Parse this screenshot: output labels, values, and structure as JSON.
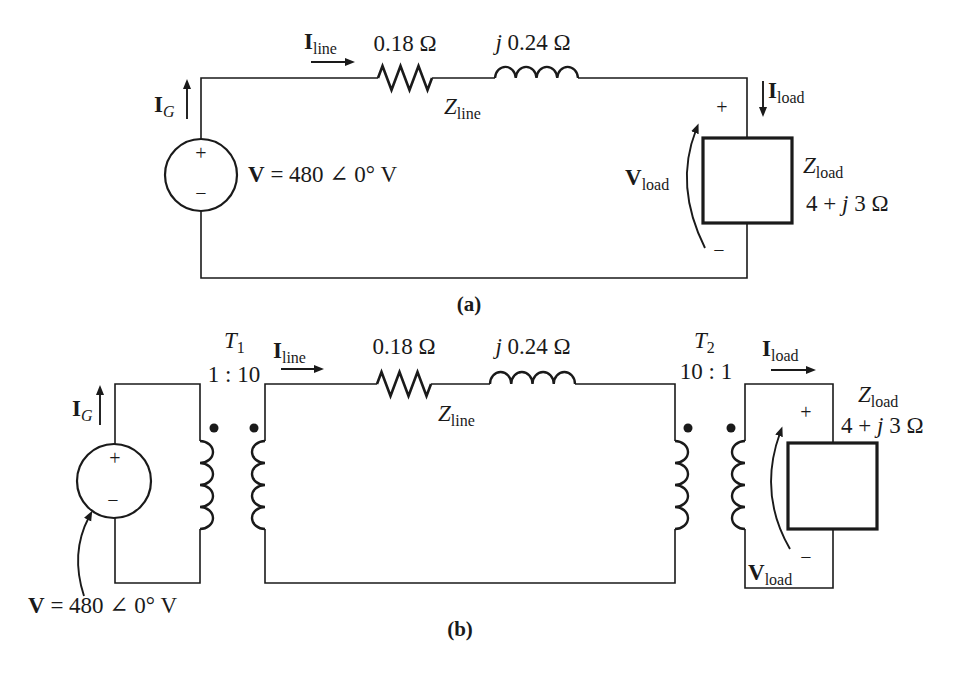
{
  "page": {
    "background": "#ffffff",
    "ink": "#1a1a1a"
  },
  "circuit_a": {
    "caption": "(a)",
    "source": {
      "plus": "+",
      "minus": "−",
      "label_v": "V",
      "label_eq": " = 480 ∠ 0° V"
    },
    "current_generator": {
      "symbol": "I",
      "sub": "G"
    },
    "current_line": {
      "symbol": "I",
      "sub": "line"
    },
    "current_load": {
      "symbol": "I",
      "sub": "load"
    },
    "line_resistor_value": "0.18 Ω",
    "line_inductor_value": {
      "j": "j",
      "rest": " 0.24 Ω"
    },
    "line_impedance": {
      "symbol": "Z",
      "sub": "line"
    },
    "load_impedance": {
      "symbol": "Z",
      "sub": "load",
      "value_pre": "4 + ",
      "value_j": "j",
      "value_post": " 3 Ω"
    },
    "load_voltage": {
      "symbol": "V",
      "sub": "load",
      "plus": "+",
      "minus": "−"
    }
  },
  "circuit_b": {
    "caption": "(b)",
    "source": {
      "plus": "+",
      "minus": "−",
      "label_v": "V",
      "label_eq": " = 480 ∠ 0° V"
    },
    "current_generator": {
      "symbol": "I",
      "sub": "G"
    },
    "current_line": {
      "symbol": "I",
      "sub": "line"
    },
    "current_load": {
      "symbol": "I",
      "sub": "load"
    },
    "transformer_1": {
      "symbol": "T",
      "sub": "1",
      "ratio": "1 : 10"
    },
    "transformer_2": {
      "symbol": "T",
      "sub": "2",
      "ratio": "10 : 1"
    },
    "line_resistor_value": "0.18 Ω",
    "line_inductor_value": {
      "j": "j",
      "rest": " 0.24 Ω"
    },
    "line_impedance": {
      "symbol": "Z",
      "sub": "line"
    },
    "load_impedance": {
      "symbol": "Z",
      "sub": "load",
      "value_pre": "4 + ",
      "value_j": "j",
      "value_post": " 3 Ω"
    },
    "load_voltage": {
      "symbol": "V",
      "sub": "load",
      "plus": "+",
      "minus": "−"
    }
  }
}
